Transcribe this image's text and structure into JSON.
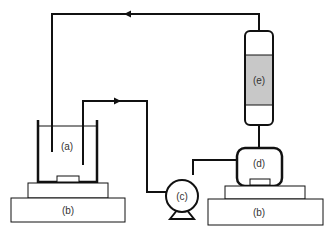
{
  "diagram": {
    "type": "experimental-setup-schematic",
    "colors": {
      "line": "#111111",
      "resin_fill": "#c8c8c8",
      "background": "#ffffff",
      "label": "#333333"
    },
    "components": {
      "a": {
        "label": "(a)",
        "description": "beaker with electrodes"
      },
      "b_left": {
        "label": "(b)",
        "description": "stirrer plate"
      },
      "c": {
        "label": "(c)",
        "description": "pump"
      },
      "d": {
        "label": "(d)",
        "description": "vessel"
      },
      "b_right": {
        "label": "(b)",
        "description": "stirrer plate"
      },
      "e": {
        "label": "(e)",
        "description": "column"
      }
    }
  }
}
